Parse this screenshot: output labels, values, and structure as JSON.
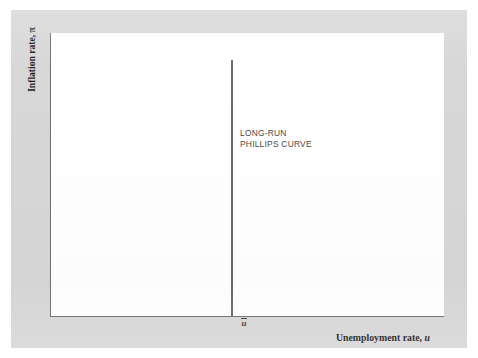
{
  "figure": {
    "kind": "economics-diagram",
    "background_color": "#ffffff",
    "frame_color": "#d7d7d7",
    "panel_color": "#ffffff",
    "axis_color": "#6f6f6f",
    "curve_color": "#6a6a6a",
    "text_color": "#1d1d1d",
    "annotation_color": "#4a4a4a"
  },
  "axes": {
    "y": {
      "title_text": "Inflation rate, ",
      "title_symbol": "π"
    },
    "x": {
      "title_text": "Unemployment rate, ",
      "title_symbol": "u"
    }
  },
  "ticks": {
    "x": [
      {
        "name": "natural-rate-of-unemployment",
        "symbol": "u",
        "has_overbar": true,
        "label": "ū"
      }
    ]
  },
  "annotations": [
    {
      "name": "long-run-phillips-curve-label",
      "line1": "LONG-RUN",
      "line2": "PHILLIPS CURVE"
    }
  ],
  "chart_data": {
    "type": "line",
    "title": "",
    "xlabel": "Unemployment rate, u",
    "ylabel": "Inflation rate, π",
    "grid": false,
    "legend": "none",
    "xlim": [
      0,
      1
    ],
    "ylim": [
      0,
      1
    ],
    "axis_ticks": {
      "x": [
        "ū"
      ],
      "y": []
    },
    "series": [
      {
        "name": "LONG-RUN PHILLIPS CURVE",
        "shape": "vertical-line",
        "x": [
          0.46,
          0.46
        ],
        "y": [
          0.0,
          0.9
        ],
        "description": "Vertical line at the natural rate of unemployment u-bar, extending from the horizontal axis upward; inflation is indeterminate in the long run."
      }
    ],
    "annotations": [
      {
        "text": "LONG-RUN PHILLIPS CURVE",
        "x": 0.48,
        "y": 0.67
      },
      {
        "text": "ū",
        "x": 0.46,
        "y": -0.02
      }
    ]
  }
}
